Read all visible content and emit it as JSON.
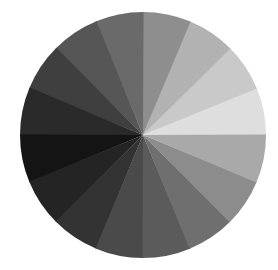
{
  "figure": {
    "background_color": "#ffffff",
    "width": 278,
    "height": 270,
    "title": ""
  },
  "chart_data": {
    "type": "pie",
    "title": "",
    "subtitle": "",
    "xlabel": "",
    "ylabel": "",
    "legend": false,
    "legend_position": "none",
    "grid": false,
    "labels_shown": false,
    "center_x": 143,
    "center_y": 135,
    "radius": 123,
    "slice_count": 16,
    "slice_angle_degrees": 22.5,
    "start_angle_degrees": 0,
    "direction": "counterclockwise",
    "categories": [
      "0-22.5",
      "22.5-45",
      "45-67.5",
      "67.5-90",
      "90-112.5",
      "112.5-135",
      "135-157.5",
      "157.5-180",
      "180-202.5",
      "202.5-225",
      "225-247.5",
      "247.5-270",
      "270-292.5",
      "292.5-315",
      "315-337.5",
      "337.5-360"
    ],
    "values": [
      6.25,
      6.25,
      6.25,
      6.25,
      6.25,
      6.25,
      6.25,
      6.25,
      6.25,
      6.25,
      6.25,
      6.25,
      6.25,
      6.25,
      6.25,
      6.25
    ],
    "colors": [
      "#dedede",
      "#c9c9c9",
      "#b2b2b2",
      "#8e8e8e",
      "#6a6a6a",
      "#565656",
      "#3f3f3f",
      "#2a2a2a",
      "#141414",
      "#242424",
      "#333333",
      "#4a4a4a",
      "#5b5b5b",
      "#6f6f6f",
      "#8c8c8c",
      "#a9a9a9"
    ],
    "gray_levels": [
      222,
      201,
      178,
      142,
      106,
      86,
      63,
      42,
      20,
      36,
      51,
      74,
      91,
      111,
      140,
      169
    ],
    "start_angles": [
      0,
      22.5,
      45,
      67.5,
      90,
      112.5,
      135,
      157.5,
      180,
      202.5,
      225,
      247.5,
      270,
      292.5,
      315,
      337.5
    ],
    "end_angles": [
      22.5,
      45,
      67.5,
      90,
      112.5,
      135,
      157.5,
      180,
      202.5,
      225,
      247.5,
      270,
      292.5,
      315,
      337.5,
      360
    ]
  }
}
